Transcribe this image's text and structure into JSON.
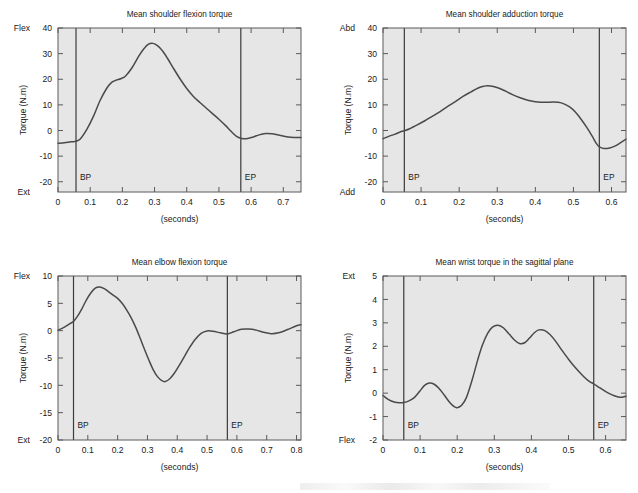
{
  "figure": {
    "background": "#ffffff",
    "plot_background": "#e6e6e6",
    "curve_color": "#4a4a4a",
    "frame_color": "#5a5a5a",
    "event_line_color": "#3a3a3a",
    "width": 638,
    "height": 493
  },
  "chart_data": [
    {
      "id": "shoulder-flexion",
      "type": "line",
      "title": "Mean shoulder flexion torque",
      "xlabel": "(seconds)",
      "ylabel": "Torque (N.m)",
      "xlim": [
        0,
        0.755
      ],
      "ylim": [
        -24,
        40
      ],
      "xticks": [
        0,
        0.1,
        0.2,
        0.3,
        0.4,
        0.5,
        0.6,
        0.7
      ],
      "xticklabels": [
        "0",
        "0.1",
        "0.2",
        "0.3",
        "0.4",
        "0.5",
        "0.6",
        "0.7"
      ],
      "yticks": [
        -20,
        -10,
        0,
        10,
        20,
        30,
        40
      ],
      "yticklabels": [
        "-20",
        "-10",
        "0",
        "10",
        "20",
        "30",
        "40"
      ],
      "top_corner_label": "Flex",
      "bottom_corner_label": "Ext",
      "grid": false,
      "annotations": [
        {
          "label": "BP",
          "x": 0.056
        },
        {
          "label": "EP",
          "x": 0.568
        }
      ],
      "x": [
        0.0,
        0.02,
        0.04,
        0.056,
        0.07,
        0.09,
        0.11,
        0.13,
        0.15,
        0.165,
        0.18,
        0.195,
        0.21,
        0.23,
        0.25,
        0.265,
        0.28,
        0.295,
        0.31,
        0.325,
        0.34,
        0.36,
        0.38,
        0.4,
        0.42,
        0.44,
        0.46,
        0.48,
        0.5,
        0.52,
        0.54,
        0.556,
        0.568,
        0.585,
        0.605,
        0.625,
        0.645,
        0.665,
        0.685,
        0.71,
        0.735,
        0.755
      ],
      "y": [
        -5.0,
        -4.8,
        -4.4,
        -4.2,
        -3.2,
        0.5,
        5.5,
        11.5,
        16.2,
        18.6,
        19.6,
        20.2,
        21.3,
        24.5,
        28.8,
        31.6,
        33.6,
        34.0,
        33.0,
        31.0,
        28.2,
        24.0,
        20.0,
        16.4,
        13.4,
        11.0,
        8.8,
        6.6,
        4.4,
        2.0,
        -0.6,
        -2.4,
        -3.0,
        -3.2,
        -2.6,
        -1.7,
        -1.2,
        -1.3,
        -1.8,
        -2.4,
        -2.7,
        -2.7
      ]
    },
    {
      "id": "shoulder-adduction",
      "type": "line",
      "title": "Mean shoulder adduction torque",
      "xlabel": "(seconds)",
      "ylabel": "Torque (N.m)",
      "xlim": [
        0,
        0.638
      ],
      "ylim": [
        -24,
        40
      ],
      "xticks": [
        0,
        0.1,
        0.2,
        0.3,
        0.4,
        0.5,
        0.6
      ],
      "xticklabels": [
        "0",
        "0.1",
        "0.2",
        "0.3",
        "0.4",
        "0.5",
        "0.6"
      ],
      "yticks": [
        -20,
        -10,
        0,
        10,
        20,
        30,
        40
      ],
      "yticklabels": [
        "-20",
        "-10",
        "0",
        "10",
        "20",
        "30",
        "40"
      ],
      "top_corner_label": "Abd",
      "bottom_corner_label": "Add",
      "grid": false,
      "annotations": [
        {
          "label": "BP",
          "x": 0.056
        },
        {
          "label": "EP",
          "x": 0.568
        }
      ],
      "x": [
        0.0,
        0.015,
        0.03,
        0.045,
        0.056,
        0.07,
        0.09,
        0.11,
        0.13,
        0.15,
        0.17,
        0.19,
        0.21,
        0.23,
        0.25,
        0.265,
        0.275,
        0.29,
        0.305,
        0.32,
        0.34,
        0.36,
        0.38,
        0.4,
        0.415,
        0.43,
        0.445,
        0.46,
        0.475,
        0.49,
        0.505,
        0.52,
        0.535,
        0.55,
        0.56,
        0.568,
        0.58,
        0.595,
        0.61,
        0.625,
        0.638
      ],
      "y": [
        -3.2,
        -2.3,
        -1.5,
        -0.6,
        -0.1,
        0.7,
        2.2,
        3.8,
        5.6,
        7.4,
        9.4,
        11.3,
        13.3,
        15.0,
        16.6,
        17.3,
        17.5,
        17.2,
        16.5,
        15.5,
        14.0,
        12.8,
        11.8,
        11.2,
        11.0,
        11.0,
        11.1,
        11.0,
        10.4,
        9.2,
        7.2,
        4.4,
        1.2,
        -2.4,
        -5.0,
        -6.4,
        -7.0,
        -6.8,
        -6.0,
        -4.6,
        -3.4
      ]
    },
    {
      "id": "elbow-flexion",
      "type": "line",
      "title": "Mean elbow flexion torque",
      "xlabel": "(seconds)",
      "ylabel": "Torque (N.m)",
      "xlim": [
        0,
        0.815
      ],
      "ylim": [
        -20,
        10
      ],
      "xticks": [
        0,
        0.1,
        0.2,
        0.3,
        0.4,
        0.5,
        0.6,
        0.7,
        0.8
      ],
      "xticklabels": [
        "0",
        "0.1",
        "0.2",
        "0.3",
        "0.4",
        "0.5",
        "0.6",
        "0.7",
        "0.8"
      ],
      "yticks": [
        -20,
        -15,
        -10,
        -5,
        0,
        5,
        10
      ],
      "yticklabels": [
        "-20",
        "-15",
        "-10",
        "-5",
        "0",
        "5",
        "10"
      ],
      "top_corner_label": "Flex",
      "bottom_corner_label": "Ext",
      "grid": false,
      "annotations": [
        {
          "label": "BP",
          "x": 0.052
        },
        {
          "label": "EP",
          "x": 0.568
        }
      ],
      "x": [
        0.0,
        0.02,
        0.04,
        0.052,
        0.065,
        0.08,
        0.095,
        0.11,
        0.125,
        0.14,
        0.155,
        0.17,
        0.185,
        0.2,
        0.215,
        0.23,
        0.245,
        0.26,
        0.275,
        0.29,
        0.305,
        0.32,
        0.335,
        0.35,
        0.36,
        0.375,
        0.39,
        0.405,
        0.42,
        0.44,
        0.46,
        0.48,
        0.5,
        0.52,
        0.545,
        0.568,
        0.59,
        0.615,
        0.64,
        0.665,
        0.69,
        0.715,
        0.74,
        0.77,
        0.8,
        0.815
      ],
      "y": [
        0.1,
        0.6,
        1.3,
        1.7,
        2.6,
        4.0,
        5.6,
        6.9,
        7.8,
        8.0,
        7.7,
        7.1,
        6.5,
        5.9,
        5.0,
        3.8,
        2.4,
        0.7,
        -1.3,
        -3.4,
        -5.4,
        -7.2,
        -8.5,
        -9.2,
        -9.3,
        -8.8,
        -7.8,
        -6.5,
        -5.1,
        -3.2,
        -1.6,
        -0.5,
        -0.05,
        -0.1,
        -0.4,
        -0.6,
        -0.2,
        0.25,
        0.3,
        0.1,
        -0.3,
        -0.55,
        -0.4,
        0.2,
        0.9,
        1.1
      ]
    },
    {
      "id": "wrist-sagittal",
      "type": "line",
      "title": "Mean wrist torque in the sagittal plane",
      "xlabel": "(seconds)",
      "ylabel": "Torque (N.m)",
      "xlim": [
        0,
        0.655
      ],
      "ylim": [
        -2,
        5
      ],
      "xticks": [
        0,
        0.1,
        0.2,
        0.3,
        0.4,
        0.5,
        0.6
      ],
      "xticklabels": [
        "0",
        "0.1",
        "0.2",
        "0.3",
        "0.4",
        "0.5",
        "0.6"
      ],
      "yticks": [
        -2,
        -1,
        0,
        1,
        2,
        3,
        4,
        5
      ],
      "yticklabels": [
        "-2",
        "-1",
        "0",
        "1",
        "2",
        "3",
        "4",
        "5"
      ],
      "top_corner_label": "Ext",
      "bottom_corner_label": "Flex",
      "grid": false,
      "annotations": [
        {
          "label": "BP",
          "x": 0.056
        },
        {
          "label": "EP",
          "x": 0.568
        }
      ],
      "x": [
        0.0,
        0.015,
        0.03,
        0.045,
        0.056,
        0.07,
        0.085,
        0.1,
        0.112,
        0.125,
        0.138,
        0.15,
        0.165,
        0.18,
        0.192,
        0.2,
        0.212,
        0.225,
        0.24,
        0.255,
        0.268,
        0.282,
        0.295,
        0.31,
        0.325,
        0.34,
        0.355,
        0.368,
        0.382,
        0.395,
        0.408,
        0.42,
        0.435,
        0.45,
        0.465,
        0.48,
        0.5,
        0.52,
        0.54,
        0.556,
        0.568,
        0.585,
        0.605,
        0.625,
        0.64,
        0.655
      ],
      "y": [
        -0.1,
        -0.28,
        -0.38,
        -0.41,
        -0.4,
        -0.33,
        -0.18,
        0.1,
        0.33,
        0.43,
        0.38,
        0.22,
        -0.08,
        -0.4,
        -0.58,
        -0.62,
        -0.52,
        -0.18,
        0.55,
        1.4,
        2.05,
        2.55,
        2.82,
        2.9,
        2.78,
        2.52,
        2.26,
        2.12,
        2.15,
        2.35,
        2.58,
        2.7,
        2.68,
        2.5,
        2.22,
        1.88,
        1.45,
        1.06,
        0.72,
        0.5,
        0.4,
        0.22,
        0.02,
        -0.12,
        -0.18,
        -0.13
      ]
    }
  ]
}
